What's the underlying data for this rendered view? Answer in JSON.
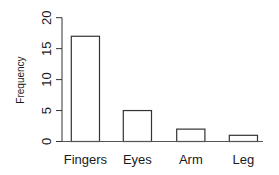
{
  "chart_data": {
    "type": "bar",
    "title": "",
    "xlabel": "",
    "ylabel": "Frequency",
    "categories": [
      "Fingers",
      "Eyes",
      "Arm",
      "Leg"
    ],
    "values": [
      17,
      5,
      2,
      1
    ],
    "ylim": [
      0,
      20
    ],
    "yticks": [
      0,
      5,
      10,
      15,
      20
    ],
    "grid": false,
    "legend": null,
    "colors": {
      "bar_fill": "#ffffff",
      "bar_stroke": "#333333",
      "axis": "#333333"
    }
  }
}
